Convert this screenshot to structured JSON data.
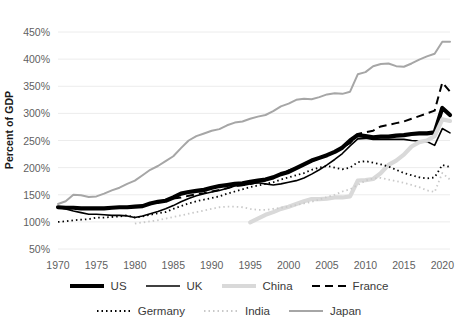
{
  "chart_data": {
    "type": "line",
    "title": "",
    "subtitle": "",
    "xlabel": "",
    "ylabel": "Percent of GDP",
    "xlim": [
      1970,
      2021
    ],
    "ylim": [
      50,
      450
    ],
    "grid": true,
    "grid_axis": "y",
    "legend_position": "bottom",
    "x_tick_labels": [
      "1970",
      "1975",
      "1980",
      "1985",
      "1990",
      "1995",
      "2000",
      "2005",
      "2010",
      "2015",
      "2020"
    ],
    "x_ticks": [
      1970,
      1975,
      1980,
      1985,
      1990,
      1995,
      2000,
      2005,
      2010,
      2015,
      2020
    ],
    "y_tick_labels": [
      "50%",
      "100%",
      "150%",
      "200%",
      "250%",
      "300%",
      "350%",
      "400%",
      "450%"
    ],
    "y_ticks": [
      50,
      100,
      150,
      200,
      250,
      300,
      350,
      400,
      450
    ],
    "x": [
      1970,
      1971,
      1972,
      1973,
      1974,
      1975,
      1976,
      1977,
      1978,
      1979,
      1980,
      1981,
      1982,
      1983,
      1984,
      1985,
      1986,
      1987,
      1988,
      1989,
      1990,
      1991,
      1992,
      1993,
      1994,
      1995,
      1996,
      1997,
      1998,
      1999,
      2000,
      2001,
      2002,
      2003,
      2004,
      2005,
      2006,
      2007,
      2008,
      2009,
      2010,
      2011,
      2012,
      2013,
      2014,
      2015,
      2016,
      2017,
      2018,
      2019,
      2020,
      2021
    ],
    "series": [
      {
        "name": "US",
        "style": "solid-thick-black",
        "color": "#000000",
        "width": 4.2,
        "dash": "none",
        "values": [
          127,
          126,
          126,
          125,
          125,
          125,
          125,
          126,
          127,
          127,
          128,
          129,
          134,
          137,
          139,
          145,
          152,
          155,
          157,
          159,
          163,
          166,
          168,
          170,
          171,
          174,
          176,
          178,
          182,
          188,
          192,
          199,
          206,
          213,
          218,
          223,
          229,
          237,
          250,
          260,
          258,
          256,
          257,
          257,
          259,
          260,
          262,
          263,
          263,
          265,
          310,
          297
        ]
      },
      {
        "name": "UK",
        "style": "solid-thin-black",
        "color": "#000000",
        "width": 1.6,
        "dash": "none",
        "values": [
          127,
          124,
          120,
          117,
          114,
          114,
          113,
          112,
          112,
          111,
          108,
          111,
          115,
          119,
          124,
          130,
          137,
          143,
          148,
          152,
          155,
          158,
          162,
          166,
          167,
          170,
          172,
          170,
          168,
          170,
          173,
          176,
          181,
          188,
          196,
          205,
          215,
          226,
          240,
          253,
          254,
          252,
          252,
          252,
          252,
          252,
          250,
          249,
          248,
          241,
          272,
          264
        ]
      },
      {
        "name": "China",
        "style": "solid-thick-lightgray",
        "color": "#d9d9d9",
        "width": 4.2,
        "dash": "none",
        "start_year": 1995,
        "values": [
          null,
          null,
          null,
          null,
          null,
          null,
          null,
          null,
          null,
          null,
          null,
          null,
          null,
          null,
          null,
          null,
          null,
          null,
          null,
          null,
          null,
          null,
          null,
          null,
          null,
          99,
          106,
          113,
          118,
          124,
          128,
          133,
          138,
          142,
          142,
          143,
          145,
          145,
          147,
          176,
          177,
          179,
          190,
          205,
          213,
          224,
          239,
          247,
          250,
          258,
          289,
          286
        ]
      },
      {
        "name": "France",
        "style": "dashed-black",
        "color": "#000000",
        "width": 2.0,
        "dash": "8 5",
        "values": [
          null,
          null,
          null,
          null,
          null,
          null,
          null,
          null,
          null,
          null,
          null,
          null,
          null,
          null,
          null,
          143,
          145,
          148,
          151,
          153,
          156,
          159,
          162,
          166,
          168,
          170,
          173,
          177,
          182,
          188,
          195,
          200,
          206,
          212,
          217,
          224,
          229,
          237,
          245,
          262,
          265,
          268,
          276,
          279,
          282,
          285,
          290,
          295,
          300,
          305,
          357,
          340
        ]
      },
      {
        "name": "Germany",
        "style": "dotted-black",
        "color": "#000000",
        "width": 1.8,
        "dash": "1.5 3",
        "values": [
          100,
          101,
          103,
          104,
          105,
          108,
          108,
          109,
          110,
          112,
          108,
          110,
          113,
          116,
          118,
          124,
          129,
          134,
          138,
          141,
          144,
          147,
          152,
          156,
          160,
          164,
          167,
          170,
          173,
          178,
          182,
          186,
          190,
          196,
          200,
          203,
          200,
          197,
          200,
          210,
          212,
          209,
          206,
          202,
          196,
          190,
          186,
          182,
          180,
          182,
          205,
          201
        ]
      },
      {
        "name": "India",
        "style": "dotted-lightgray",
        "color": "#c9c9c9",
        "width": 1.8,
        "dash": "1.5 3",
        "values": [
          null,
          null,
          null,
          null,
          null,
          null,
          null,
          null,
          null,
          null,
          97,
          99,
          101,
          103,
          106,
          109,
          112,
          115,
          118,
          121,
          124,
          127,
          128,
          128,
          127,
          124,
          122,
          122,
          124,
          126,
          128,
          131,
          134,
          137,
          141,
          146,
          150,
          156,
          160,
          168,
          176,
          180,
          181,
          178,
          175,
          172,
          168,
          164,
          158,
          155,
          190,
          178
        ]
      },
      {
        "name": "Japan",
        "style": "solid-gray",
        "color": "#a6a6a6",
        "width": 2.0,
        "dash": "none",
        "values": [
          133,
          138,
          150,
          149,
          146,
          147,
          152,
          158,
          163,
          170,
          176,
          186,
          196,
          203,
          212,
          221,
          236,
          250,
          258,
          263,
          268,
          271,
          278,
          283,
          285,
          290,
          294,
          297,
          304,
          313,
          318,
          325,
          327,
          326,
          330,
          335,
          337,
          336,
          340,
          372,
          376,
          387,
          391,
          392,
          387,
          386,
          392,
          399,
          405,
          410,
          432,
          432
        ]
      }
    ]
  },
  "legend": {
    "rows": [
      [
        {
          "label": "US",
          "swatch": "solid-thick-black"
        },
        {
          "label": "UK",
          "swatch": "solid-thin-black"
        },
        {
          "label": "China",
          "swatch": "solid-thick-lightgray"
        },
        {
          "label": "France",
          "swatch": "dashed-black"
        }
      ],
      [
        {
          "label": "Germany",
          "swatch": "dotted-black"
        },
        {
          "label": "India",
          "swatch": "dotted-lightgray"
        },
        {
          "label": "Japan",
          "swatch": "solid-gray"
        }
      ]
    ]
  },
  "colors": {
    "gridline": "#ececec",
    "tick_text": "#5f5f5f",
    "axis_title": "#1a1a1a",
    "background": "#ffffff"
  }
}
